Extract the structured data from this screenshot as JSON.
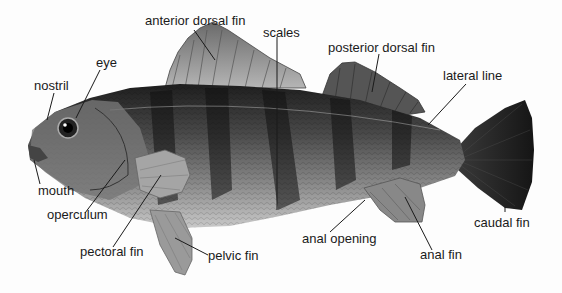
{
  "diagram": {
    "background": "#fdfdfd",
    "label_color": "#1a1a1a",
    "labels": {
      "anterior_dorsal_fin": "anterior dorsal fin",
      "scales": "scales",
      "posterior_dorsal_fin": "posterior dorsal fin",
      "lateral_line": "lateral line",
      "eye": "eye",
      "nostril": "nostril",
      "mouth": "mouth",
      "operculum": "operculum",
      "pectoral_fin": "pectoral fin",
      "pelvic_fin": "pelvic fin",
      "anal_opening": "anal opening",
      "anal_fin": "anal fin",
      "caudal_fin": "caudal fin"
    }
  }
}
